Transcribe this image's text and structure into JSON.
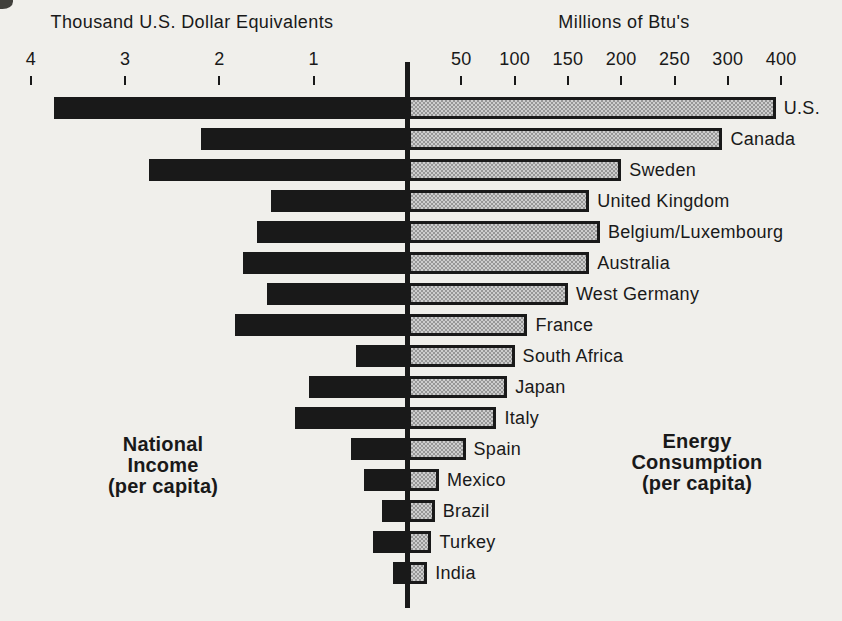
{
  "chart_data": {
    "type": "bar",
    "orientation": "horizontal-bidirectional",
    "left_axis_title": "Thousand U.S. Dollar Equivalents",
    "right_axis_title": "Millions of Btu's",
    "left_caption": "National\nIncome\n(per capita)",
    "right_caption": "Energy\nConsumption\n(per capita)",
    "categories": [
      "U.S.",
      "Canada",
      "Sweden",
      "United Kingdom",
      "Belgium/Luxembourg",
      "Australia",
      "West Germany",
      "France",
      "South Africa",
      "Japan",
      "Italy",
      "Spain",
      "Mexico",
      "Brazil",
      "Turkey",
      "India"
    ],
    "series": [
      {
        "name": "National Income (per capita)",
        "unit": "Thousand U.S. Dollar Equivalents",
        "side": "left",
        "values": [
          3.75,
          2.2,
          2.75,
          1.45,
          1.6,
          1.75,
          1.5,
          1.83,
          0.55,
          1.05,
          1.2,
          0.6,
          0.47,
          0.28,
          0.37,
          0.16
        ]
      },
      {
        "name": "Energy Consumption (per capita)",
        "unit": "Millions of Btu's",
        "side": "right",
        "values": [
          390,
          295,
          200,
          170,
          180,
          170,
          150,
          112,
          100,
          93,
          83,
          54,
          29,
          25,
          22,
          18
        ]
      }
    ],
    "left_axis_ticks": [
      "4",
      "3",
      "2",
      "1"
    ],
    "right_axis_ticks": [
      "50",
      "100",
      "150",
      "200",
      "250",
      "300",
      "400"
    ],
    "left_axis_range": [
      0,
      4
    ],
    "right_axis_note": "ticks evenly spaced; the step after 300 is labeled 400",
    "grid": false,
    "legend": "none",
    "colors": {
      "ink": "#191919",
      "paper": "#f0efeb",
      "halftone_dark": "#969696",
      "halftone_light": "#cdcdcd"
    }
  }
}
